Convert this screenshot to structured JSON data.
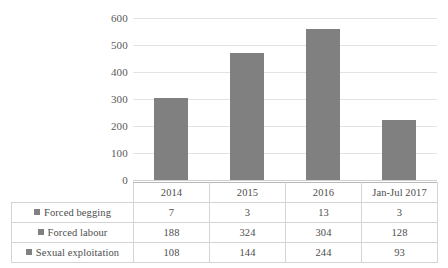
{
  "chart_data": {
    "type": "bar",
    "stacked": true,
    "title": "",
    "subtitle": "",
    "xlabel": "",
    "ylabel": "",
    "ylim": [
      0,
      600
    ],
    "y_ticks": [
      0,
      100,
      200,
      300,
      400,
      500,
      600
    ],
    "grid": true,
    "legend_position": "data-table-left",
    "categories": [
      "2014",
      "2015",
      "2016",
      "Jan-Jul 2017"
    ],
    "series": [
      {
        "name": "Forced begging",
        "values": [
          7,
          3,
          13,
          3
        ],
        "color": "#808080"
      },
      {
        "name": "Forced labour",
        "values": [
          188,
          324,
          304,
          128
        ],
        "color": "#808080"
      },
      {
        "name": "Sexual exploitation",
        "values": [
          108,
          144,
          244,
          93
        ],
        "color": "#808080"
      }
    ],
    "totals": [
      303,
      471,
      561,
      224
    ],
    "bar_color": "#808080",
    "gridline_color": "#e3e3e3",
    "axis_color": "#cfcfcf"
  },
  "axis": {
    "y_tick_labels": [
      "600",
      "500",
      "400",
      "300",
      "200",
      "100",
      "0"
    ]
  },
  "table": {
    "corner_label": "",
    "column_headers": [
      "2014",
      "2015",
      "2016",
      "Jan-Jul 2017"
    ],
    "rows": [
      {
        "label": "Forced begging",
        "values": [
          "7",
          "3",
          "13",
          "3"
        ]
      },
      {
        "label": "Forced labour",
        "values": [
          "188",
          "324",
          "304",
          "128"
        ]
      },
      {
        "label": "Sexual exploitation",
        "values": [
          "108",
          "144",
          "244",
          "93"
        ]
      }
    ]
  }
}
